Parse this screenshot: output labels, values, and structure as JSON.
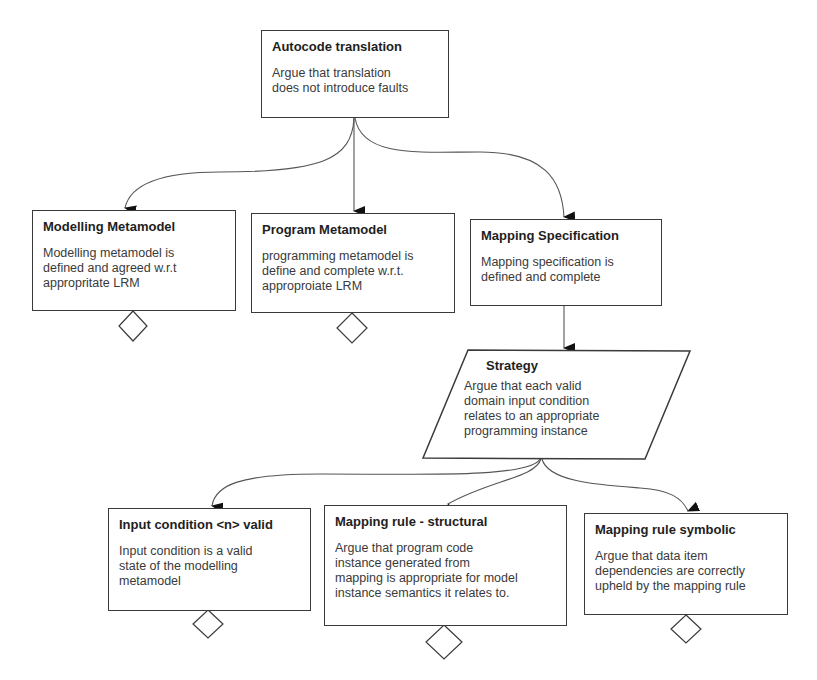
{
  "nodes": {
    "autocode": {
      "title": "Autocode translation",
      "body": "Argue that translation\ndoes not introduce faults"
    },
    "modelling": {
      "title": "Modelling Metamodel",
      "body": "Modelling metamodel is\n defined and agreed w.r.t\nappropritate LRM"
    },
    "program": {
      "title": "Program Metamodel",
      "body": "programming metamodel is\n  define and complete w.r.t.\napproproiate LRM"
    },
    "mapping_spec": {
      "title": "Mapping Specification",
      "body": "Mapping specification is\ndefined and complete"
    },
    "strategy": {
      "title": "Strategy",
      "body": "Argue that each valid\ndomain input condition\nrelates to an appropriate\nprogramming instance"
    },
    "input_condition": {
      "title": "Input condition <n> valid",
      "body": "Input condition is a valid\nstate of the modelling\nmetamodel"
    },
    "rule_structural": {
      "title": "Mapping rule - structural",
      "body": "Argue that program code\ninstance generated from\nmapping is appropriate for model\ninstance semantics it relates to."
    },
    "rule_symbolic": {
      "title": "Mapping rule symbolic",
      "body": "Argue that data item\ndependencies are correctly\nupheld by the mapping rule"
    }
  },
  "undeveloped_markers": [
    "modelling",
    "program",
    "input_condition",
    "rule_structural",
    "rule_symbolic"
  ],
  "colors": {
    "line": "#3a3a3a",
    "text": "#2a2a2a",
    "background": "#ffffff"
  }
}
